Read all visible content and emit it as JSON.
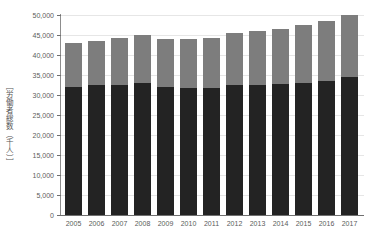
{
  "chart_data": {
    "type": "bar",
    "stacked": true,
    "title": "",
    "xlabel": "",
    "ylabel": "［労働者総数（千人）］",
    "ylim": [
      0,
      50000
    ],
    "ytick_step": 5000,
    "grid": true,
    "legend": "none",
    "categories": [
      "2005",
      "2006",
      "2007",
      "2008",
      "2009",
      "2010",
      "2011",
      "2012",
      "2013",
      "2014",
      "2015",
      "2016",
      "2017"
    ],
    "ytick_labels": [
      "50,000",
      "45,000",
      "40,000",
      "35,000",
      "30,000",
      "25,000",
      "20,000",
      "15,000",
      "10,000",
      "5,000",
      "0"
    ],
    "ytick_values": [
      50000,
      45000,
      40000,
      35000,
      30000,
      25000,
      20000,
      15000,
      10000,
      5000,
      0
    ],
    "series": [
      {
        "name": "lower-segment",
        "color": "#232323",
        "values": [
          32100,
          32400,
          32600,
          33100,
          31900,
          31800,
          31800,
          32400,
          32400,
          32800,
          33000,
          33600,
          34500
        ]
      },
      {
        "name": "upper-segment",
        "color": "#7d7d7d",
        "values": [
          10900,
          11100,
          11600,
          11800,
          12000,
          12200,
          12500,
          13200,
          13500,
          13700,
          14500,
          15000,
          15400
        ]
      }
    ],
    "totals": [
      43000,
      43500,
      44200,
      44900,
      43900,
      44000,
      44300,
      45600,
      45900,
      46500,
      47500,
      48600,
      49900
    ]
  },
  "colors": {
    "lower_segment": "#232323",
    "upper_segment": "#7d7d7d",
    "gridline": "#e6e6e6",
    "axis": "#6f6f6f",
    "tick_text": "#5b5b5b",
    "background": "#ffffff"
  }
}
